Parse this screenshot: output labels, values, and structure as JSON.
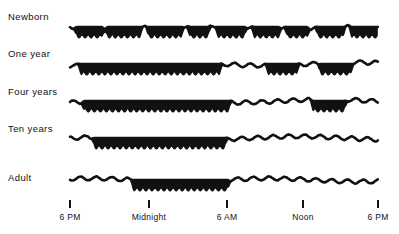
{
  "figure": {
    "title": "",
    "background_color": "#ffffff",
    "ink_color": "#111111"
  },
  "axis": {
    "name": "time-of-day-axis",
    "tick_marks": [
      {
        "label": "6 PM",
        "hour": 18,
        "x": 70
      },
      {
        "label": "Midnight",
        "hour": 24,
        "x": 149
      },
      {
        "label": "6 AM",
        "hour": 30,
        "x": 227
      },
      {
        "label": "Noon",
        "hour": 36,
        "x": 303
      },
      {
        "label": "6 PM",
        "hour": 42,
        "x": 378
      }
    ],
    "tick_y": 200,
    "tick_height": 8,
    "label_y": 214
  },
  "rows": [
    {
      "label": "Newborn",
      "baseline_y": 27,
      "label_x": 8,
      "label_y": 16
    },
    {
      "label": "One year",
      "baseline_y": 64,
      "label_x": 8,
      "label_y": 53
    },
    {
      "label": "Four years",
      "baseline_y": 101,
      "label_x": 8,
      "label_y": 90
    },
    {
      "label": "Ten years",
      "baseline_y": 138,
      "label_x": 8,
      "label_y": 127
    },
    {
      "label": "Adult",
      "baseline_y": 180,
      "label_x": 8,
      "label_y": 180
    }
  ],
  "chart_data": {
    "type": "area",
    "xlabel": "Time of day",
    "ylabel": "",
    "xlim": [
      18,
      42
    ],
    "grid": false,
    "legend": null,
    "x_tick_labels": [
      "6 PM",
      "Midnight",
      "6 AM",
      "Noon",
      "6 PM"
    ],
    "x_tick_hours": [
      18,
      24,
      30,
      36,
      42
    ],
    "categories": [
      "Newborn",
      "One year",
      "Four years",
      "Ten years",
      "Adult"
    ],
    "series": [
      {
        "name": "Newborn",
        "sleep_intervals": [
          [
            18.6,
            20.4
          ],
          [
            21.0,
            23.4
          ],
          [
            24.2,
            26.6
          ],
          [
            27.4,
            28.7
          ],
          [
            29.6,
            31.5
          ],
          [
            32.4,
            34.2
          ],
          [
            35.0,
            36.4
          ],
          [
            37.4,
            39.2
          ],
          [
            40.0,
            42.0
          ]
        ],
        "sleep_fraction": 0.66,
        "description": "Many short sleep bouts distributed evenly across the entire 24 hours, roughly every 3-4 hours."
      },
      {
        "name": "One year",
        "sleep_intervals": [
          [
            18.9,
            29.6
          ],
          [
            33.5,
            35.6
          ],
          [
            37.6,
            39.8
          ]
        ],
        "sleep_fraction": 0.62,
        "description": "Long consolidated night sleep from early evening until about 6 AM, plus two daytime naps."
      },
      {
        "name": "Four years",
        "sleep_intervals": [
          [
            19.2,
            30.3
          ],
          [
            37.0,
            39.3
          ]
        ],
        "sleep_fraction": 0.55,
        "description": "Long night sleep plus a single afternoon nap."
      },
      {
        "name": "Ten years",
        "sleep_intervals": [
          [
            20.0,
            30.0
          ]
        ],
        "sleep_fraction": 0.42,
        "description": "One consolidated nighttime sleep block, no daytime naps."
      },
      {
        "name": "Adult",
        "sleep_intervals": [
          [
            23.0,
            30.2
          ]
        ],
        "sleep_fraction": 0.3,
        "description": "Sleep onset is later (about 11 PM) and sleep ends around 6 AM; no daytime sleep."
      }
    ]
  }
}
